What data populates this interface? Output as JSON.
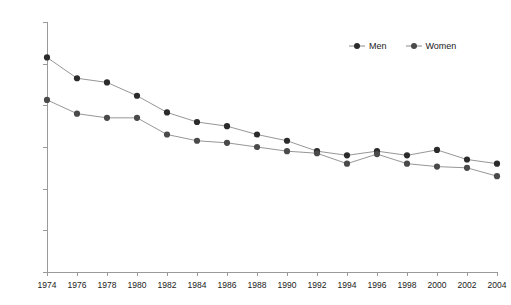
{
  "chart_data": {
    "type": "line",
    "title": "",
    "subtitle": "",
    "xlabel": "",
    "ylabel": "",
    "categories": [
      "1974",
      "1976",
      "1978",
      "1980",
      "1982",
      "1984",
      "1986",
      "1988",
      "1990",
      "1992",
      "1994",
      "1996",
      "1998",
      "2000",
      "2002",
      "2004"
    ],
    "x": [
      1974,
      1976,
      1978,
      1980,
      1982,
      1984,
      1986,
      1988,
      1990,
      1992,
      1994,
      1996,
      1998,
      2000,
      2002,
      2004
    ],
    "series": [
      {
        "name": "Men",
        "color": "#2b2b2b",
        "values": [
          51.5,
          46.5,
          45.5,
          42.3,
          38.3,
          36.0,
          35.0,
          33.0,
          31.5,
          29.0,
          28.0,
          29.0,
          28.0,
          29.3,
          27.0,
          26.0
        ]
      },
      {
        "name": "Women",
        "color": "#4a4a4a",
        "values": [
          41.3,
          38.0,
          37.0,
          37.0,
          33.0,
          31.5,
          31.0,
          30.0,
          29.0,
          28.5,
          26.0,
          28.3,
          26.0,
          25.3,
          25.0,
          23.0
        ]
      }
    ],
    "ylim": [
      0,
      60
    ],
    "ytick_values": [
      0,
      10,
      20,
      30,
      40,
      50,
      60
    ],
    "ytick_labels": [
      "0%",
      "10%",
      "20%",
      "30%",
      "40%",
      "50%",
      "60%"
    ],
    "xlim": [
      1974,
      2004
    ],
    "grid": false,
    "legend_position": "top-right",
    "line_color": "#8a8a8a",
    "marker_color": "#2b2b2b",
    "axis_color": "#9a9a9a",
    "background": "#ffffff"
  },
  "legend": {
    "items": [
      {
        "label": "Men"
      },
      {
        "label": "Women"
      }
    ]
  }
}
